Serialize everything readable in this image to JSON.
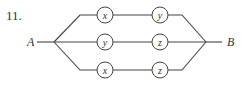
{
  "problem": {
    "number": "11."
  },
  "diagram": {
    "type": "series-parallel network",
    "terminals": {
      "start": "A",
      "end": "B"
    },
    "branches": [
      {
        "position": "top",
        "nodes": [
          "x",
          "y"
        ]
      },
      {
        "position": "middle",
        "nodes": [
          "y",
          "z"
        ]
      },
      {
        "position": "bottom",
        "nodes": [
          "x",
          "z"
        ]
      }
    ],
    "colors": {
      "line": "#444444",
      "text": "#333333",
      "background": "#ffffff"
    }
  }
}
